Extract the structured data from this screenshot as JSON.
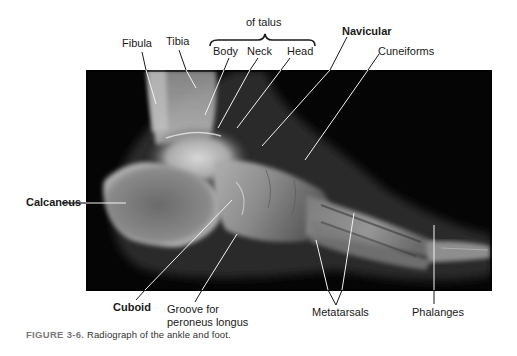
{
  "figure": {
    "number": "FIGURE 3-6.",
    "caption": " Radiograph of the ankle and foot.",
    "image_description": "Lateral radiograph of the ankle and foot"
  },
  "labels": {
    "talus_group": "of talus",
    "fibula": "Fibula",
    "tibia": "Tibia",
    "body": "Body",
    "neck": "Neck",
    "head": "Head",
    "navicular": "Navicular",
    "cuneiforms": "Cuneiforms",
    "calcaneus": "Calcaneus",
    "cuboid": "Cuboid",
    "groove_line1": "Groove for",
    "groove_line2": "peroneus longus",
    "metatarsals": "Metatarsals",
    "phalanges": "Phalanges"
  },
  "colors": {
    "background": "#ffffff",
    "xray_background": "#050505",
    "leader_line_on_image": "#f2f2f2",
    "leader_line_off_image": "#1a1a1a",
    "caption_figure_number": "#7a7a7a"
  }
}
